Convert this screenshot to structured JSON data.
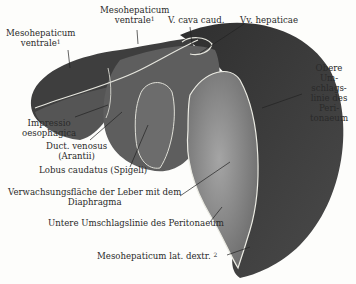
{
  "figure": {
    "colors": {
      "background": "#fdfdfb",
      "dark_lobe": "#3d3d3d",
      "mid_surface": "#6a6a6a",
      "bare_area": "#8e8e8e",
      "outline": "#e8e8e0",
      "text": "#2a2a2a"
    }
  },
  "labels": {
    "mesohepaticum_ventrale_left": {
      "line1": "Mesohepaticum",
      "line2": "ventrale",
      "sup": "1"
    },
    "mesohepaticum_ventrale_top": {
      "line1": "Mesohepaticum",
      "line2": "ventrale",
      "sup": "1"
    },
    "v_cava": "V. cava caud.",
    "vv_hepaticae": "Vv. hepaticae",
    "obere": [
      "Obere",
      "Um-",
      "schlags-",
      "linie des",
      "Peri-",
      "tonaeum"
    ],
    "impressio": [
      "Impressio",
      "oesophagica"
    ],
    "duct_venosus": [
      "Duct. venosus",
      "(Arantii)"
    ],
    "lobus_caudatus": "Lobus caudatus (Spigeli)",
    "verwachsung": [
      "Verwachsungsfläche der Leber mit dem",
      "Diaphragma"
    ],
    "untere": "Untere Umschlagslinie des Peritonaeum",
    "mesohepaticum_lat": {
      "text": "Mesohepaticum lat. dextr.",
      "sup": "2"
    }
  }
}
